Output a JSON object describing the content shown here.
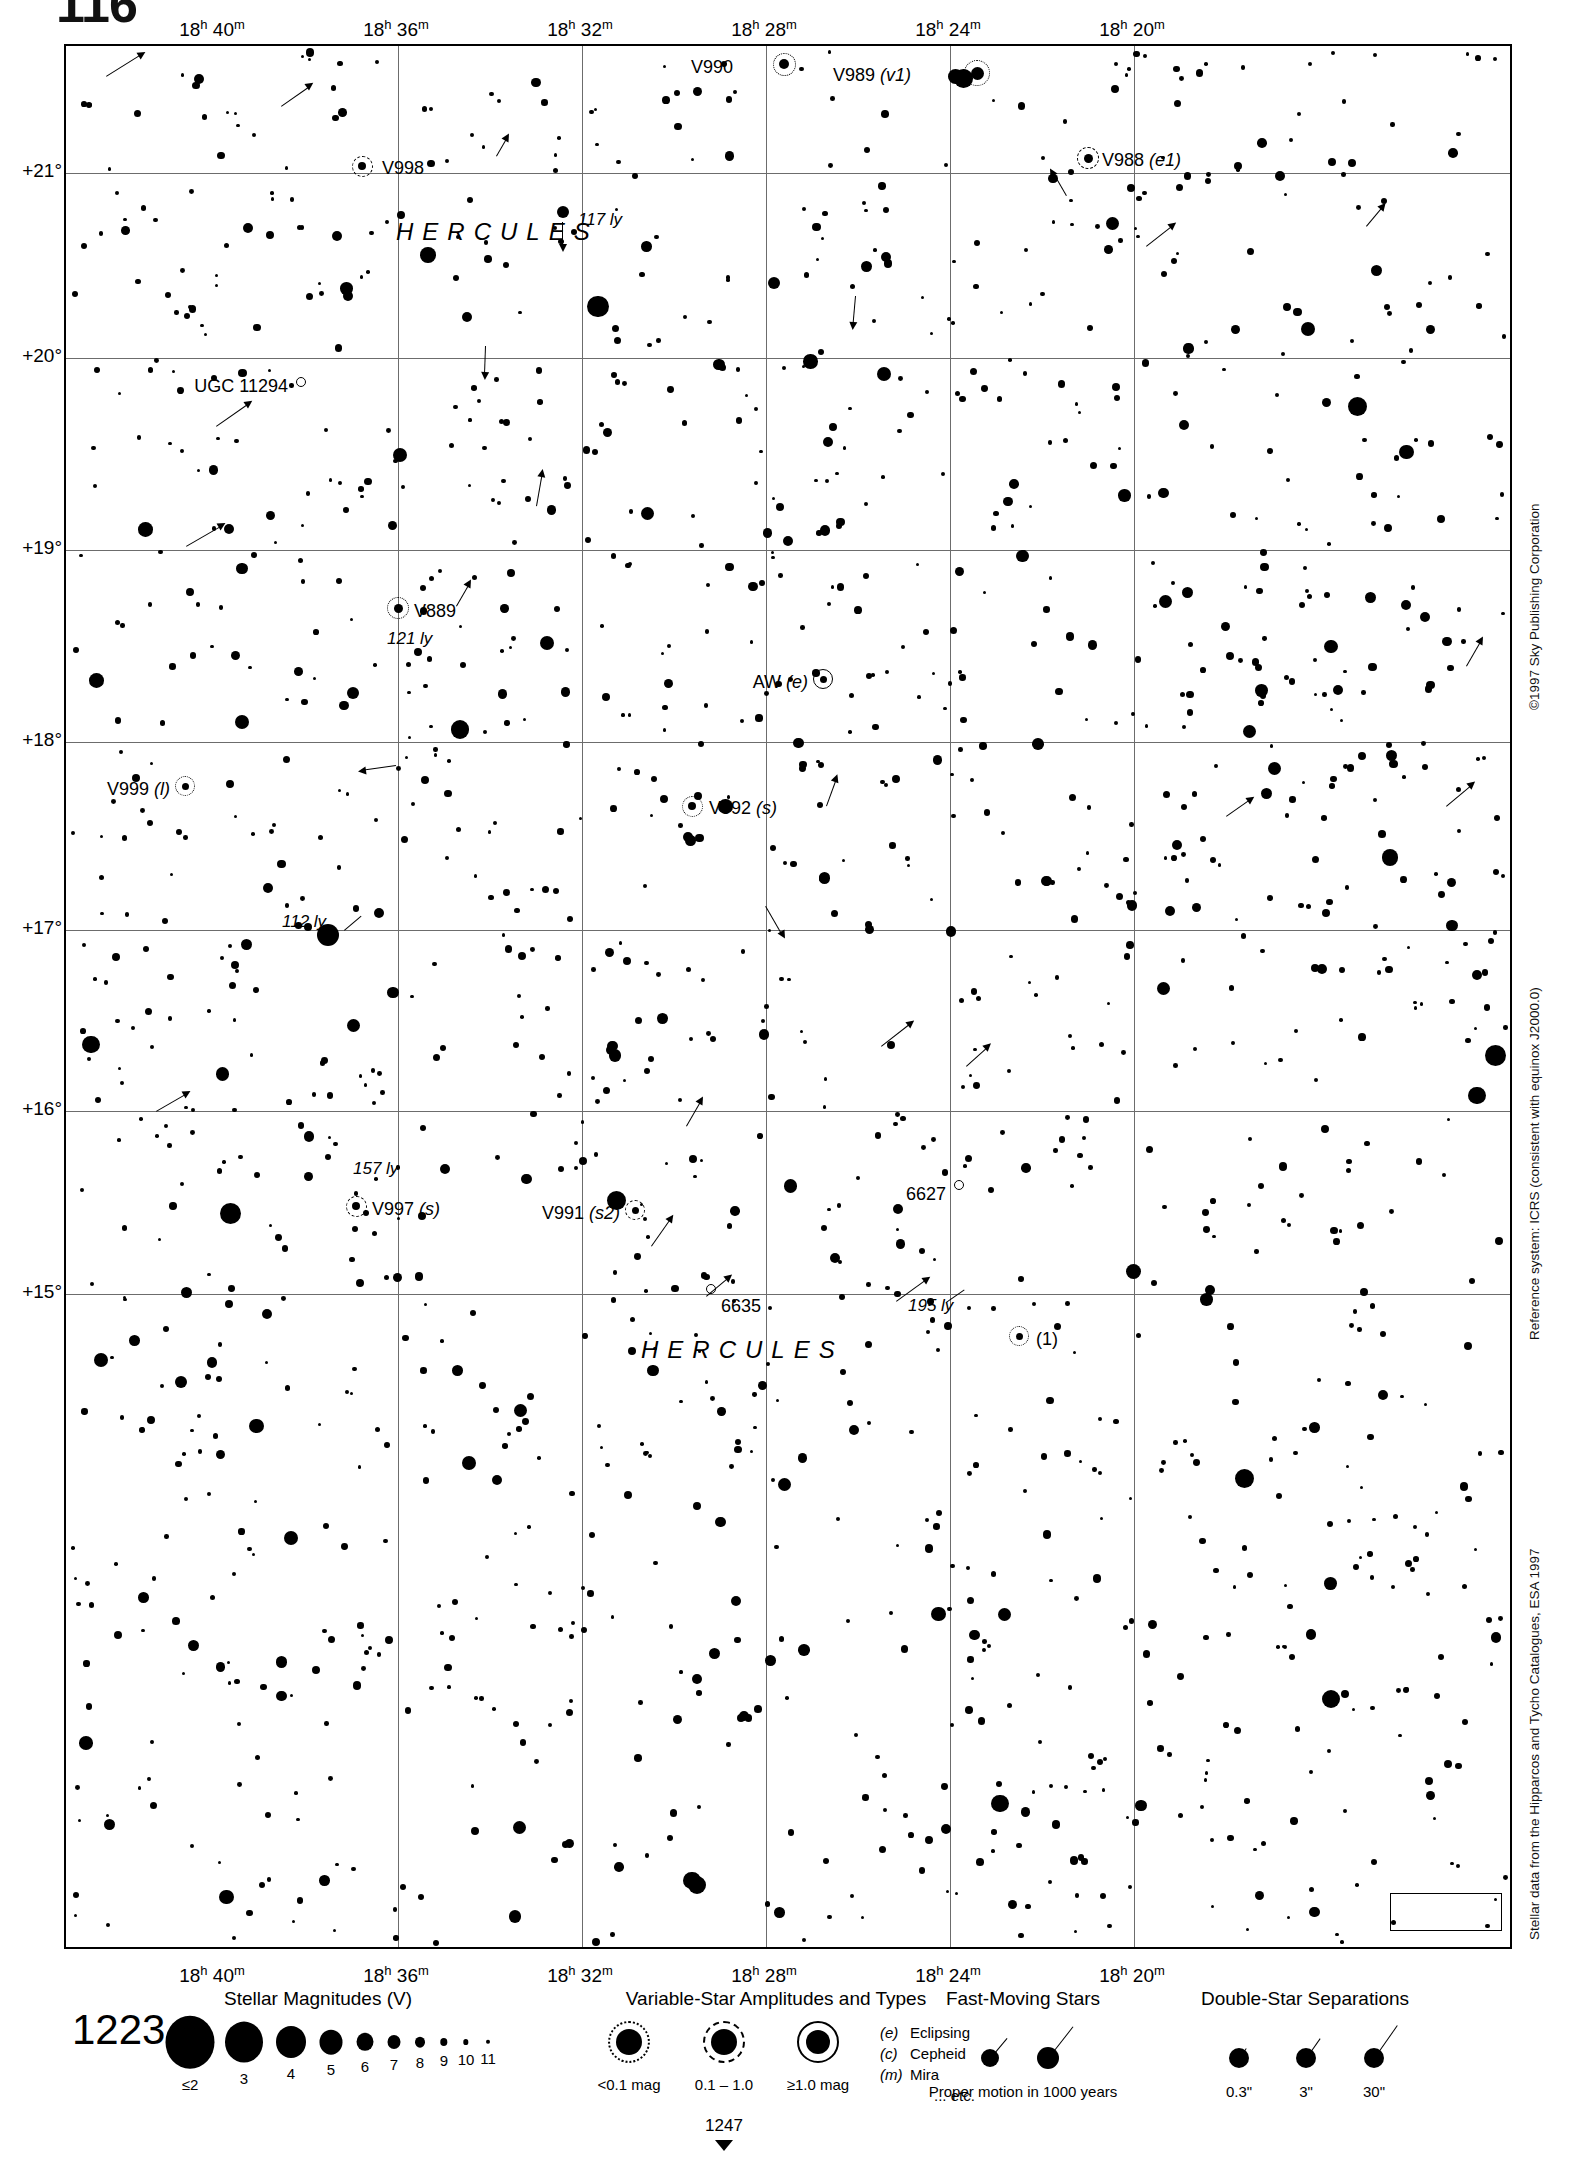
{
  "page": {
    "folio": "116",
    "header_note": "",
    "chart_number": "1223",
    "next_chart_number": "1247"
  },
  "credits": {
    "copyright": "©1997 Sky Publishing Corporation",
    "reference_system": "Reference system: ICRS (consistent with equinox J2000.0)",
    "data_source": "Stellar data from the Hipparcos and Tycho Catalogues, ESA 1997"
  },
  "axes": {
    "ra_ticks": [
      {
        "label": "18h 40m",
        "h": "18",
        "m": "40",
        "x": 148
      },
      {
        "label": "18h 36m",
        "h": "18",
        "m": "36",
        "x": 332
      },
      {
        "label": "18h 32m",
        "h": "18",
        "m": "32",
        "x": 516
      },
      {
        "label": "18h 28m",
        "h": "18",
        "m": "28",
        "x": 700
      },
      {
        "label": "18h 24m",
        "h": "18",
        "m": "24",
        "x": 884
      },
      {
        "label": "18h 20m",
        "h": "18",
        "m": "20",
        "x": 1068
      }
    ],
    "dec_ticks": [
      {
        "label": "+21°",
        "y": 127
      },
      {
        "label": "+20°",
        "y": 312
      },
      {
        "label": "+19°",
        "y": 504
      },
      {
        "label": "+18°",
        "y": 696
      },
      {
        "label": "+17°",
        "y": 884
      },
      {
        "label": "+16°",
        "y": 1065
      },
      {
        "label": "+15°",
        "y": 1248
      }
    ]
  },
  "constellation_labels": [
    {
      "name": "HERCULES",
      "x": 330,
      "y": 172
    },
    {
      "name": "HERCULES",
      "x": 575,
      "y": 1290
    }
  ],
  "objects": [
    {
      "id": "V990",
      "label": "V990",
      "type": "variable",
      "amp": "dotted",
      "mag_r": 5.0,
      "x": 718,
      "y": 18,
      "label_x": 667,
      "label_y": 11,
      "label_align": "right"
    },
    {
      "id": "V989",
      "label": "V989 (v1)",
      "type": "variable",
      "amp": "dotted",
      "mag_r": 6.5,
      "x": 911,
      "y": 27,
      "label_x": 845,
      "label_y": 19,
      "label_align": "right"
    },
    {
      "id": "V988",
      "label": "V988 (e1)",
      "type": "variable",
      "amp": "dashed",
      "mag_r": 4.5,
      "x": 1022,
      "y": 112,
      "label_x": 1036,
      "label_y": 104,
      "label_align": "left"
    },
    {
      "id": "V998",
      "label": "V998",
      "type": "variable",
      "amp": "dashed",
      "mag_r": 4.0,
      "x": 296,
      "y": 120,
      "label_x": 316,
      "label_y": 112,
      "label_align": "left"
    },
    {
      "id": "UGC11294",
      "label": "UGC 11294",
      "type": "galaxy",
      "amp": "",
      "mag_r": 5.0,
      "x": 235,
      "y": 336,
      "label_x": 222,
      "label_y": 330,
      "label_align": "right"
    },
    {
      "id": "V889",
      "label": "V889",
      "type": "variable",
      "amp": "dotted",
      "mag_r": 4.5,
      "x": 332,
      "y": 562,
      "label_x": 348,
      "label_y": 555,
      "label_align": "left"
    },
    {
      "id": "AW",
      "label": "AW (e)",
      "type": "variable",
      "amp": "solid",
      "mag_r": 3.5,
      "x": 757,
      "y": 633,
      "label_x": 742,
      "label_y": 626,
      "label_align": "right"
    },
    {
      "id": "V999",
      "label": "V999 (l)",
      "type": "variable",
      "amp": "dotted",
      "mag_r": 3.5,
      "x": 119,
      "y": 740,
      "label_x": 104,
      "label_y": 733,
      "label_align": "right"
    },
    {
      "id": "V992",
      "label": "V992 (s)",
      "type": "variable",
      "amp": "dotted",
      "mag_r": 4.0,
      "x": 626,
      "y": 760,
      "label_x": 643,
      "label_y": 752,
      "label_align": "left"
    },
    {
      "id": "6627",
      "label": "6627",
      "type": "cluster",
      "amp": "",
      "mag_r": 5.0,
      "x": 893,
      "y": 1139,
      "label_x": 880,
      "label_y": 1138,
      "label_align": "right"
    },
    {
      "id": "V997",
      "label": "V997 (s)",
      "type": "variable",
      "amp": "dashed",
      "mag_r": 4.0,
      "x": 290,
      "y": 1160,
      "label_x": 306,
      "label_y": 1153,
      "label_align": "left"
    },
    {
      "id": "V991",
      "label": "V991 (s2)",
      "type": "variable",
      "amp": "dashed",
      "mag_r": 3.5,
      "x": 569,
      "y": 1164,
      "label_x": 554,
      "label_y": 1157,
      "label_align": "right"
    },
    {
      "id": "6635",
      "label": "6635",
      "type": "cluster",
      "amp": "",
      "mag_r": 5.0,
      "x": 645,
      "y": 1243,
      "label_x": 655,
      "label_y": 1250,
      "label_align": "left"
    },
    {
      "id": "dbl1",
      "label": "(1)",
      "type": "variable",
      "amp": "dotted",
      "mag_r": 3.5,
      "x": 953,
      "y": 1290,
      "label_x": 970,
      "label_y": 1283,
      "label_align": "left"
    }
  ],
  "distance_labels": [
    {
      "text": "117 ly",
      "x": 512,
      "y": 164
    },
    {
      "text": "121 ly",
      "x": 321,
      "y": 583
    },
    {
      "text": "112 ly",
      "x": 216,
      "y": 866
    },
    {
      "text": "157 ly",
      "x": 287,
      "y": 1113
    },
    {
      "text": "195 ly",
      "x": 842,
      "y": 1250
    }
  ],
  "legend": {
    "magnitudes": {
      "title": "Stellar Magnitudes (V)",
      "title_x": 318,
      "entries": [
        {
          "label": "≤2",
          "r": 24.5,
          "x": 190
        },
        {
          "label": "3",
          "r": 19.0,
          "x": 244
        },
        {
          "label": "4",
          "r": 15.0,
          "x": 291
        },
        {
          "label": "5",
          "r": 11.5,
          "x": 331
        },
        {
          "label": "6",
          "r": 8.5,
          "x": 365
        },
        {
          "label": "7",
          "r": 6.5,
          "x": 394
        },
        {
          "label": "8",
          "r": 5.0,
          "x": 420
        },
        {
          "label": "9",
          "r": 3.7,
          "x": 444
        },
        {
          "label": "10",
          "r": 2.7,
          "x": 466
        },
        {
          "label": "11",
          "r": 2.0,
          "x": 488
        }
      ]
    },
    "variables": {
      "title": "Variable-Star Amplitudes and Types",
      "title_x": 776,
      "entries": [
        {
          "label": "<0.1 mag",
          "ring": "dotted",
          "x": 629
        },
        {
          "label": "0.1 – 1.0",
          "ring": "dashed",
          "x": 724
        },
        {
          "label": "≥1.0 mag",
          "ring": "solid",
          "x": 818
        }
      ],
      "types": [
        {
          "code": "(e)",
          "name": "Eclipsing"
        },
        {
          "code": "(c)",
          "name": "Cepheid"
        },
        {
          "code": "(m)",
          "name": "Mira"
        },
        {
          "code": "",
          "name": "... etc."
        }
      ]
    },
    "fast_moving": {
      "title": "Fast-Moving Stars",
      "title_x": 1023,
      "caption": "Proper motion in 1000 years",
      "caption_x": 1023
    },
    "double_stars": {
      "title": "Double-Star Separations",
      "title_x": 1305,
      "entries": [
        {
          "label": "0.3\"",
          "x": 1239,
          "len": 12
        },
        {
          "label": "3\"",
          "x": 1306,
          "len": 24
        },
        {
          "label": "30\"",
          "x": 1374,
          "len": 40
        }
      ]
    }
  },
  "starfield": {
    "note": "Scatter of field stars rendered procedurally from seeded positions."
  }
}
